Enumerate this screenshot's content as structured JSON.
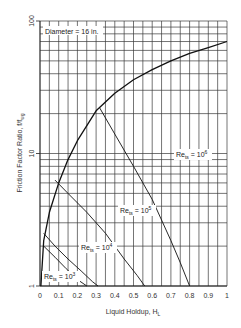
{
  "chart_data": {
    "type": "line",
    "title": "",
    "xlabel": "Liquid Holdup, H",
    "xlabel_sub": "L",
    "ylabel": "Friction Factor Ratio, f/f",
    "ylabel_sub": "wg",
    "xlim": [
      0,
      1
    ],
    "ylim": [
      1,
      100
    ],
    "yscale": "log",
    "grid": true,
    "x_ticks": [
      "0",
      "0.1",
      "0.2",
      "0.3",
      "0.4",
      "0.5",
      "0.6",
      "0.7",
      "0.8",
      "0.9",
      "1"
    ],
    "y_ticks": [
      "1",
      "10",
      "100"
    ],
    "annotations": [
      {
        "text": "Diameter = 16 in.",
        "x": 0.02,
        "y": 70
      }
    ],
    "series": [
      {
        "name": "Envelope",
        "x": [
          0.005,
          0.02,
          0.05,
          0.1,
          0.15,
          0.2,
          0.3,
          0.4,
          0.5,
          0.6,
          0.7,
          0.8,
          0.9,
          1.0
        ],
        "y": [
          1.0,
          2.2,
          3.6,
          6.0,
          9.0,
          12.5,
          21.0,
          28.5,
          36.0,
          43.0,
          50.0,
          57.0,
          63.0,
          70.0
        ]
      },
      {
        "name": "Re_ts = 10^6",
        "label": "Re",
        "label_sub": "ts",
        "label_exp": "6",
        "x": [
          0.32,
          0.4,
          0.5,
          0.6,
          0.7,
          0.75,
          0.8
        ],
        "y": [
          22.0,
          14.0,
          8.0,
          4.5,
          2.2,
          1.5,
          1.0
        ]
      },
      {
        "name": "Re_ts = 10^5",
        "label": "Re",
        "label_sub": "ts",
        "label_exp": "5",
        "x": [
          0.08,
          0.15,
          0.25,
          0.35,
          0.45,
          0.52,
          0.56
        ],
        "y": [
          6.3,
          5.0,
          3.6,
          2.5,
          1.6,
          1.2,
          1.0
        ]
      },
      {
        "name": "Re_ts = 10^4",
        "label": "Re",
        "label_sub": "ts",
        "label_exp": "4",
        "x": [
          0.02,
          0.08,
          0.15,
          0.22,
          0.28,
          0.31
        ],
        "y": [
          2.5,
          2.0,
          1.6,
          1.3,
          1.08,
          1.0
        ]
      },
      {
        "name": "Re_ts = 10^3",
        "label": "Re",
        "label_sub": "ts",
        "label_exp": "3",
        "x": [
          0.02,
          0.08,
          0.14,
          0.2,
          0.25
        ],
        "y": [
          2.0,
          1.65,
          1.35,
          1.12,
          1.0
        ]
      }
    ]
  }
}
